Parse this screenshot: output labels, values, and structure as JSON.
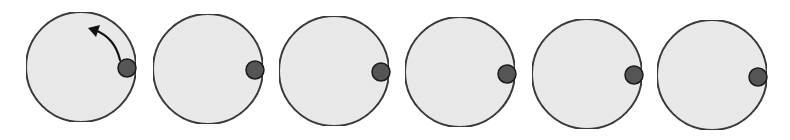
{
  "diagram": {
    "colors": {
      "background": "#ffffff",
      "circle_fill": "#ebebeb",
      "circle_stroke": "#222222",
      "dot_fill": "#555555",
      "dot_stroke": "#1a1a1a",
      "arrow": "#111111"
    },
    "circles": [
      {
        "cx": 81,
        "cy": 67,
        "r": 55,
        "dot": {
          "cx": 127,
          "cy": 68,
          "r": 9
        },
        "arrow": true
      },
      {
        "cx": 208,
        "cy": 69,
        "r": 55,
        "dot": {
          "cx": 255,
          "cy": 70,
          "r": 9
        },
        "arrow": false
      },
      {
        "cx": 334,
        "cy": 71,
        "r": 55,
        "dot": {
          "cx": 381,
          "cy": 72,
          "r": 9
        },
        "arrow": false
      },
      {
        "cx": 460,
        "cy": 72,
        "r": 55,
        "dot": {
          "cx": 507,
          "cy": 74,
          "r": 9
        },
        "arrow": false
      },
      {
        "cx": 587,
        "cy": 74,
        "r": 55,
        "dot": {
          "cx": 634,
          "cy": 75,
          "r": 9
        },
        "arrow": false
      },
      {
        "cx": 712,
        "cy": 75,
        "r": 55,
        "dot": {
          "cx": 758,
          "cy": 77,
          "r": 9
        },
        "arrow": false
      }
    ],
    "rotation_arrow": {
      "direction": "counter-clockwise",
      "path": "M 120 60 Q 115 38 95 30",
      "tip": [
        88,
        28
      ]
    }
  }
}
